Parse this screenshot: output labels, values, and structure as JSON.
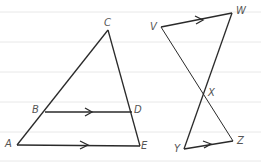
{
  "figure_left": {
    "name": "triangle ACE with segment BD parallel to AE",
    "points": {
      "A": {
        "label": "A",
        "x": 17,
        "y": 145
      },
      "B": {
        "label": "B",
        "x": 45,
        "y": 112
      },
      "C": {
        "label": "C",
        "x": 108,
        "y": 30
      },
      "D": {
        "label": "D",
        "x": 132,
        "y": 112
      },
      "E": {
        "label": "E",
        "x": 140,
        "y": 146
      }
    }
  },
  "figure_right": {
    "name": "segments VZ and WY intersecting at X with VW parallel to YZ",
    "points": {
      "V": {
        "label": "V",
        "x": 161,
        "y": 27
      },
      "W": {
        "label": "W",
        "x": 232,
        "y": 13
      },
      "X": {
        "label": "X",
        "x": 204,
        "y": 94
      },
      "Y": {
        "label": "Y",
        "x": 184,
        "y": 149
      },
      "Z": {
        "label": "Z",
        "x": 233,
        "y": 141
      }
    }
  },
  "colors": {
    "line": "#2a2a2a",
    "ruled": "#e6e6e6",
    "label": "#555555"
  }
}
